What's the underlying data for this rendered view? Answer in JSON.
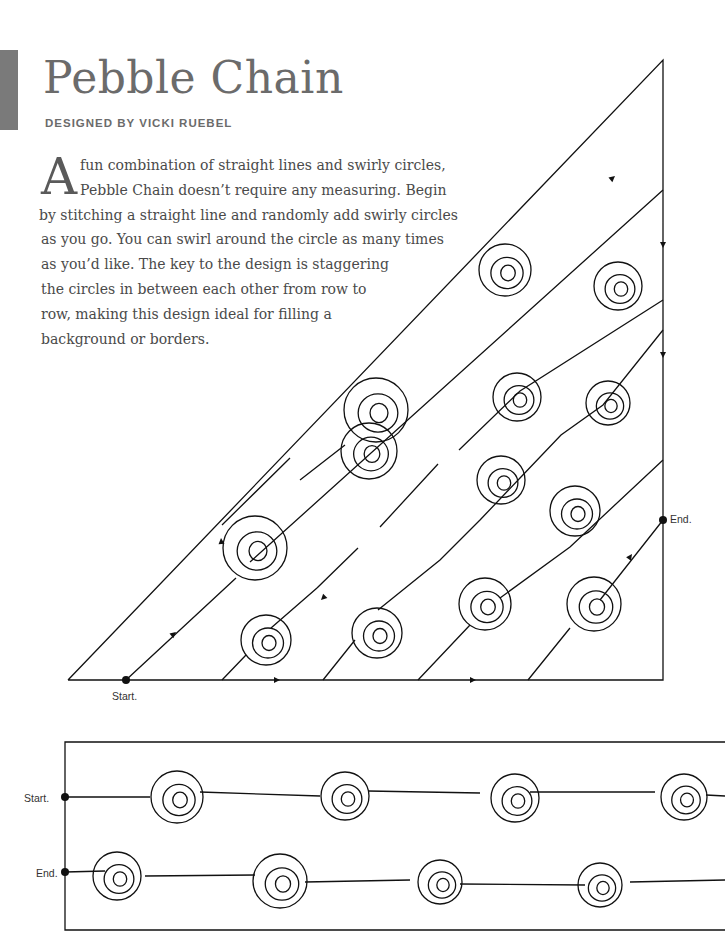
{
  "header": {
    "title": "Pebble Chain",
    "byline": "DESIGNED BY VICKI RUEBEL",
    "accent_color": "#7a7a7a"
  },
  "intro": {
    "drop_cap": "A",
    "lines": [
      "fun combination of straight lines and swirly circles,",
      "Pebble Chain doesn’t require any measuring. Begin",
      "by stitching a straight line and randomly add swirly circles",
      "as you go. You can swirl around the circle as many times",
      "as you’d like. The key to the design is staggering",
      "the circles in between each other from row to",
      "row, making this design ideal for filling a",
      "background or borders."
    ]
  },
  "triangle_diagram": {
    "start_label": "Start.",
    "end_label": "End.",
    "rows": 5,
    "swirl_count": 10
  },
  "border_diagram": {
    "start_label": "Start.",
    "end_label": "End.",
    "rows": 2,
    "swirls_per_row": 4
  }
}
